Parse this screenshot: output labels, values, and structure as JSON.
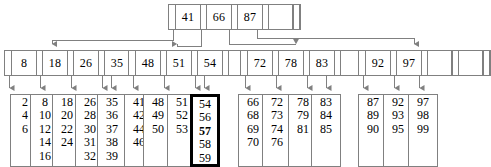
{
  "diagram": {
    "line_color": "#808080",
    "highlight_color": "#000000",
    "background": "#ffffff"
  },
  "root": {
    "label": "root-node",
    "keys": [
      "41",
      "66",
      "87",
      ""
    ],
    "pointer_count": 4
  },
  "internal_nodes": [
    {
      "label": "internal-node-1",
      "keys": [
        "8",
        "18",
        "26",
        "35"
      ]
    },
    {
      "label": "internal-node-2",
      "keys": [
        "48",
        "51",
        "54",
        ""
      ]
    },
    {
      "label": "internal-node-3",
      "keys": [
        "72",
        "78",
        "83",
        ""
      ]
    },
    {
      "label": "internal-node-4",
      "keys": [
        "92",
        "97",
        "",
        ""
      ]
    }
  ],
  "leaves": [
    {
      "label": "leaf-1",
      "values": [
        "2",
        "4",
        "6"
      ],
      "highlight": false,
      "bold_value": null
    },
    {
      "label": "leaf-2",
      "values": [
        "8",
        "10",
        "12",
        "14",
        "16"
      ],
      "highlight": false,
      "bold_value": null
    },
    {
      "label": "leaf-3",
      "values": [
        "18",
        "20",
        "22",
        "24"
      ],
      "highlight": false,
      "bold_value": null
    },
    {
      "label": "leaf-4",
      "values": [
        "26",
        "28",
        "30",
        "31",
        "32"
      ],
      "highlight": false,
      "bold_value": null
    },
    {
      "label": "leaf-5",
      "values": [
        "35",
        "36",
        "37",
        "38",
        "39"
      ],
      "highlight": false,
      "bold_value": null
    },
    {
      "label": "leaf-6",
      "values": [
        "41",
        "42",
        "44",
        "46"
      ],
      "highlight": false,
      "bold_value": null
    },
    {
      "label": "leaf-7",
      "values": [
        "48",
        "49",
        "50"
      ],
      "highlight": false,
      "bold_value": null
    },
    {
      "label": "leaf-8",
      "values": [
        "51",
        "52",
        "53"
      ],
      "highlight": false,
      "bold_value": null
    },
    {
      "label": "leaf-9",
      "values": [
        "54",
        "56",
        "57",
        "58",
        "59"
      ],
      "highlight": true,
      "bold_value": "57"
    },
    {
      "label": "leaf-10",
      "values": [
        "66",
        "68",
        "69",
        "70"
      ],
      "highlight": false,
      "bold_value": null
    },
    {
      "label": "leaf-11",
      "values": [
        "72",
        "73",
        "74",
        "76"
      ],
      "highlight": false,
      "bold_value": null
    },
    {
      "label": "leaf-12",
      "values": [
        "78",
        "79",
        "81"
      ],
      "highlight": false,
      "bold_value": null
    },
    {
      "label": "leaf-13",
      "values": [
        "83",
        "84",
        "85"
      ],
      "highlight": false,
      "bold_value": null
    },
    {
      "label": "leaf-14",
      "values": [
        "87",
        "89",
        "90"
      ],
      "highlight": false,
      "bold_value": null
    },
    {
      "label": "leaf-15",
      "values": [
        "92",
        "93",
        "95"
      ],
      "highlight": false,
      "bold_value": null
    },
    {
      "label": "leaf-16",
      "values": [
        "97",
        "98",
        "99"
      ],
      "highlight": false,
      "bold_value": null
    }
  ],
  "layout": {
    "root": {
      "x": 168,
      "y": 4,
      "key_width": 24
    },
    "internal": [
      {
        "x": 4,
        "y": 50,
        "key_width": 24,
        "trailing": 0
      },
      {
        "x": 128,
        "y": 50,
        "key_width": 24,
        "trailing": 1
      },
      {
        "x": 240,
        "y": 50,
        "key_width": 24,
        "trailing": 1
      },
      {
        "x": 358,
        "y": 50,
        "key_width": 24,
        "trailing": 2
      }
    ],
    "leaf_x": [
      10,
      30,
      52,
      75,
      97,
      124,
      143,
      167,
      190,
      238,
      262,
      288,
      311,
      358,
      383,
      408
    ],
    "leaf_y": 94
  }
}
